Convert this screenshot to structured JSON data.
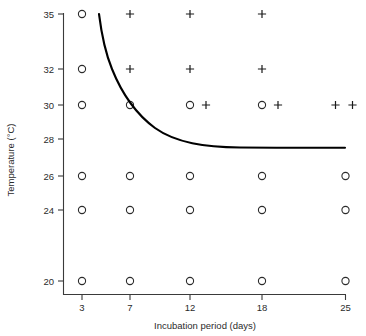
{
  "chart_data": {
    "type": "scatter",
    "title": "",
    "xlabel": "Incubation period (days)",
    "ylabel": "Temperature (°C)",
    "x_tick_labels": [
      "3",
      "7",
      "12",
      "18",
      "25"
    ],
    "x_tick_values": [
      3,
      7,
      12,
      18,
      25
    ],
    "y_tick_labels": [
      "20",
      "24",
      "26",
      "28",
      "30",
      "32",
      "35"
    ],
    "y_tick_values": [
      20,
      24,
      26,
      28,
      30,
      32,
      35
    ],
    "xlim": [
      3,
      25
    ],
    "ylim": [
      20,
      35
    ],
    "grid": false,
    "legend": null,
    "axis_note": "non-linear spacing on both axes; categorical tick placement",
    "series": [
      {
        "name": "circle-marker",
        "symbol": "○",
        "points": [
          {
            "x": 3,
            "y": 35
          },
          {
            "x": 3,
            "y": 32
          },
          {
            "x": 3,
            "y": 30
          },
          {
            "x": 7,
            "y": 30
          },
          {
            "x": 12,
            "y": 30
          },
          {
            "x": 18,
            "y": 30
          },
          {
            "x": 3,
            "y": 26
          },
          {
            "x": 7,
            "y": 26
          },
          {
            "x": 12,
            "y": 26
          },
          {
            "x": 18,
            "y": 26
          },
          {
            "x": 25,
            "y": 26
          },
          {
            "x": 3,
            "y": 24
          },
          {
            "x": 7,
            "y": 24
          },
          {
            "x": 12,
            "y": 24
          },
          {
            "x": 18,
            "y": 24
          },
          {
            "x": 25,
            "y": 24
          },
          {
            "x": 3,
            "y": 20
          },
          {
            "x": 7,
            "y": 20
          },
          {
            "x": 12,
            "y": 20
          },
          {
            "x": 18,
            "y": 20
          },
          {
            "x": 25,
            "y": 20
          }
        ]
      },
      {
        "name": "plus-marker",
        "symbol": "+",
        "points": [
          {
            "x": 7,
            "y": 35
          },
          {
            "x": 12,
            "y": 35
          },
          {
            "x": 18,
            "y": 35
          },
          {
            "x": 7,
            "y": 32
          },
          {
            "x": 12,
            "y": 32
          },
          {
            "x": 18,
            "y": 32
          },
          {
            "x": 12,
            "y": 30,
            "offset": "right"
          },
          {
            "x": 18,
            "y": 30,
            "offset": "right"
          },
          {
            "x": 25,
            "y": 30
          },
          {
            "x": 25,
            "y": 30,
            "offset": "right"
          }
        ]
      }
    ],
    "curve": {
      "name": "threshold-boundary",
      "description": "decaying boundary curve from 35 °C descending to an asymptote near 27.7 °C",
      "asymptote_y": 27.7,
      "start": {
        "x": 4.4,
        "y": 35
      },
      "end": {
        "x": 25,
        "y": 27.7
      }
    }
  },
  "colors": {
    "axis": "#3a3a3a",
    "marker": "#2b2b2b",
    "curve": "#000000",
    "background": "#ffffff"
  }
}
